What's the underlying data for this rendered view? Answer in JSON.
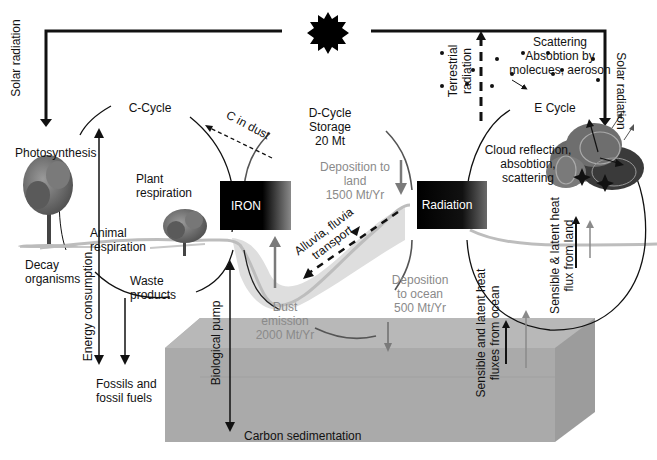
{
  "colors": {
    "ink": "#111111",
    "grey_text": "#8a8a8a",
    "grey_arrow": "#7a7a7a",
    "ocean_top": "#b4b4b4",
    "ocean_front": "#a9a9a9",
    "ocean_side": "#9a9a9a",
    "land_line": "#bdbdbd",
    "dust_fill": "#d9d9d9"
  },
  "sun": {
    "icon": "sun-icon"
  },
  "top_radiation": {
    "left_label": "Solar radiation",
    "right_label": "Solar radiation",
    "terrestrial_label_line1": "Terrestrial",
    "terrestrial_label_line2": "radiation"
  },
  "atmosphere": {
    "scattering_line1": "Scattering",
    "scattering_line2": "Absobtion by",
    "scattering_line3": "molecues, aeroson"
  },
  "c_cycle": {
    "title": "C-Cycle",
    "c_in_dust": "C in dust",
    "photosynthesis": "Photosynthesis",
    "plant_respiration_line1": "Plant",
    "plant_respiration_line2": "respiration",
    "animal_respiration_line1": "Animal",
    "animal_respiration_line2": "respiration",
    "decay_line1": "Decay",
    "decay_line2": "organisms",
    "waste_line1": "Waste",
    "waste_line2": "products",
    "energy_consumption": "Energy consumption",
    "fossils_line1": "Fossils and",
    "fossils_line2": "fossil fuels",
    "biological_pump": "Biological pump",
    "carbon_sedimentation": "Carbon sedimentation"
  },
  "d_cycle": {
    "title_line1": "D-Cycle",
    "title_line2": "Storage",
    "title_line3": "20 Mt",
    "dep_land_line1": "Deposition to",
    "dep_land_line2": "land",
    "dep_land_line3": "1500 Mt/Yr",
    "alluvia_line1": "Alluvia, fluvia",
    "alluvia_line2": "transport",
    "dust_line1": "Dust",
    "dust_line2": "emission",
    "dust_line3": "2000 Mt/Yr",
    "dep_ocean_line1": "Deposition",
    "dep_ocean_line2": "to ocean",
    "dep_ocean_line3": "500 Mt/Yr"
  },
  "e_cycle": {
    "title": "E Cycle",
    "cloud_line1": "Cloud reflection,",
    "cloud_line2": "absobtion,",
    "cloud_line3": "scattering",
    "land_flux_line1": "Sensible & latent heat",
    "land_flux_line2": "flux from land",
    "ocean_flux_line1": "Sensible and latent heat",
    "ocean_flux_line2": "fluxes from ocean"
  },
  "boxes": {
    "iron": "IRON",
    "radiation": "Radiation"
  }
}
